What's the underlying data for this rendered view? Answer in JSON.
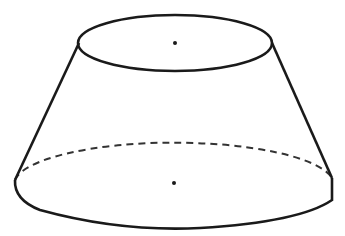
{
  "diagram": {
    "type": "frustum-of-cone",
    "stroke_color": "#1a1a1a",
    "background": "#ffffff",
    "top_base": {
      "cx": 175,
      "cy": 43,
      "rx": 97,
      "ry": 28
    },
    "bottom_base": {
      "cx": 174,
      "cy": 183,
      "rx": 160,
      "ry": 44
    },
    "center_points": [
      {
        "label": "top-center",
        "x": 175,
        "y": 43
      },
      {
        "label": "bottom-center",
        "x": 174,
        "y": 183
      }
    ]
  }
}
